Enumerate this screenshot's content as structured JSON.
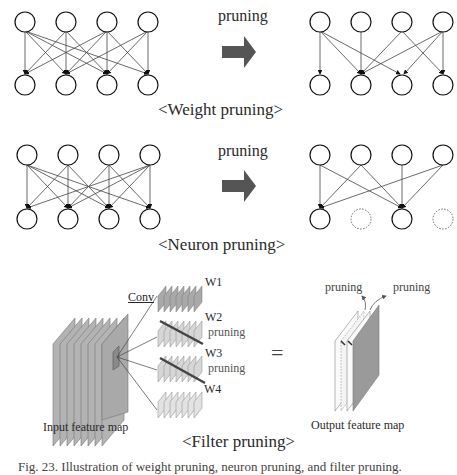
{
  "colors": {
    "arrow": "#555555",
    "edge": "#333333",
    "node_stroke": "#111111",
    "pruned_node": "#666666",
    "feature_map_dark": "#a9a9a9",
    "feature_map_light": "#d3d3d3",
    "output_dark": "#9a9a9a"
  },
  "weight_pruning": {
    "arrow_label": "pruning",
    "title": "<Weight pruning>"
  },
  "neuron_pruning": {
    "arrow_label": "pruning",
    "title": "<Neuron pruning>"
  },
  "filter_pruning": {
    "conv_label": "Conv",
    "filters": [
      {
        "label": "W1",
        "pruned": false
      },
      {
        "label": "W2",
        "pruned": true
      },
      {
        "label": "W3",
        "pruned": true
      },
      {
        "label": "W4",
        "pruned": false
      }
    ],
    "pruning_label_1": "pruning",
    "pruning_label_2": "pruning",
    "equals": "=",
    "output_pruning_label_1": "pruning",
    "output_pruning_label_2": "pruning",
    "input_label": "Input feature map",
    "output_label": "Output feature map",
    "title": "<Filter pruning>"
  },
  "caption": "Fig. 23. Illustration of weight pruning, neuron pruning, and filter pruning."
}
